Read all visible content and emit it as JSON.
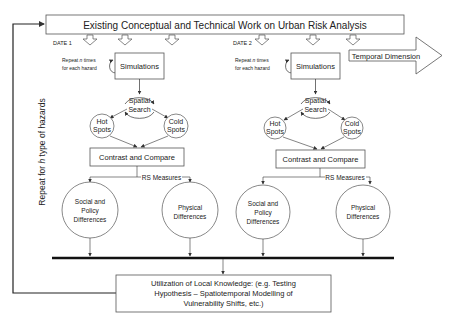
{
  "diagram": {
    "top_box": {
      "label": "Existing Conceptual and Technical Work on Urban Risk Analysis"
    },
    "side_label": {
      "prefix": "Repeat for ",
      "var": "h",
      "suffix": " type of hazards"
    },
    "temporal_arrow": {
      "label": "Temporal Dimension"
    },
    "panels": [
      {
        "date_label": "DATE 1",
        "repeat_note": {
          "line1_prefix": "Repeat ",
          "line1_var": "n",
          "line1_suffix": " times",
          "line2": "for each hazard"
        },
        "simulations": "Simulations",
        "spatial_search": {
          "line1": "Spatial",
          "line2": "Search"
        },
        "hot_spots": {
          "line1": "Hot",
          "line2": "Spots"
        },
        "cold_spots": {
          "line1": "Cold",
          "line2": "Spots"
        },
        "contrast": "Contrast and Compare",
        "rs_measures": "RS Measures",
        "social": {
          "line1": "Social and",
          "line2": "Policy",
          "line3": "Differences"
        },
        "physical": {
          "line1": "Physical",
          "line2": "Differences"
        }
      },
      {
        "date_label": "DATE 2",
        "repeat_note": {
          "line1_prefix": "Repeat ",
          "line1_var": "n",
          "line1_suffix": " times",
          "line2": "for each hazard"
        },
        "simulations": "Simulations",
        "spatial_search": {
          "line1": "Spatial",
          "line2": "Search"
        },
        "hot_spots": {
          "line1": "Hot",
          "line2": "Spots"
        },
        "cold_spots": {
          "line1": "Cold",
          "line2": "Spots"
        },
        "contrast": "Contrast and Compare",
        "rs_measures": "RS Measures",
        "social": {
          "line1": "Social and",
          "line2": "Policy",
          "line3": "Differences"
        },
        "physical": {
          "line1": "Physical",
          "line2": "Differences"
        }
      }
    ],
    "bottom_box": {
      "line1": "Utilization of Local Knowledge: (e.g. Testing",
      "line2": "Hypothesis – Spatiotemporal Modelling of",
      "line3": "Vulnerability Shifts, etc.)"
    },
    "colors": {
      "stroke": "#555555",
      "text": "#222222",
      "background": "#ffffff"
    }
  }
}
